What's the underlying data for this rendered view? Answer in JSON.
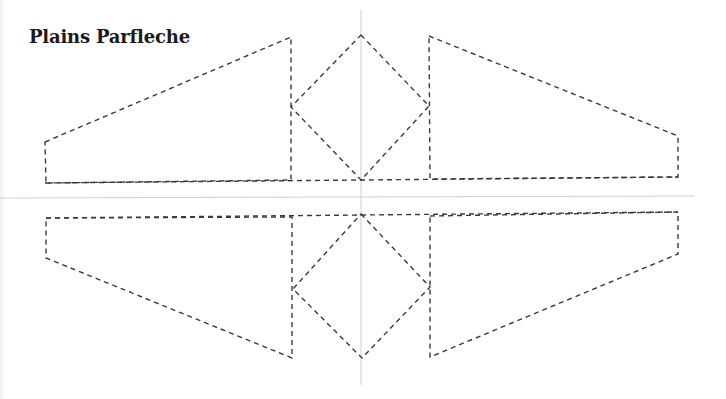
{
  "title": "Plains Parfleche",
  "diagram": {
    "type": "cut-out pattern template",
    "line_style": "dashed",
    "colors": {
      "cut_line": "#3a3a3a",
      "guide_line": "#cfcfcf",
      "background": "#ffffff"
    },
    "guides": {
      "vertical": {
        "x": 361,
        "y1": 10,
        "y2": 385
      },
      "horizontal": {
        "y": 197,
        "x1": 0,
        "x2": 695
      }
    },
    "top_half": {
      "left_flap": "45,142 291,37 291,180 46,183",
      "diamond": "361,35 429,106 361,180 291,107",
      "right_flap": "429,36 678,136 678,177 430,179",
      "base_line": "45,183 678,177"
    },
    "bottom_half": {
      "left_flap": "46,218 292,217 292,358 46,258",
      "diamond": "361,214 430,287 362,358 293,289",
      "right_flap": "430,216 678,212 678,254 430,357",
      "base_line": "46,218 678,212"
    }
  }
}
